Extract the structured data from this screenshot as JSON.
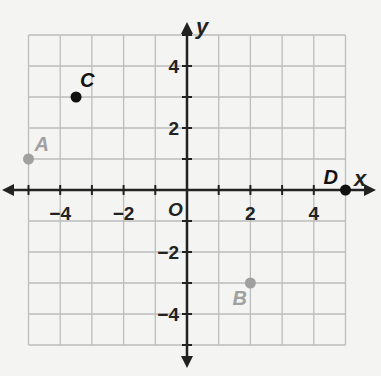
{
  "axes": {
    "x_label": "x",
    "y_label": "y",
    "origin_label": "O",
    "x_ticks": [
      {
        "value": -4,
        "label": "−4"
      },
      {
        "value": -2,
        "label": "−2"
      },
      {
        "value": 2,
        "label": "2"
      },
      {
        "value": 4,
        "label": "4"
      }
    ],
    "y_ticks": [
      {
        "value": 4,
        "label": "4"
      },
      {
        "value": 2,
        "label": "2"
      },
      {
        "value": -2,
        "label": "−2"
      },
      {
        "value": -4,
        "label": "−4"
      }
    ],
    "range": {
      "x": [
        -5,
        5
      ],
      "y": [
        -5,
        5
      ]
    }
  },
  "points": [
    {
      "name": "A",
      "x": -5,
      "y": 1,
      "color": "#a0a0a0"
    },
    {
      "name": "B",
      "x": 2,
      "y": -3,
      "color": "#a0a0a0"
    },
    {
      "name": "C",
      "x": -3.5,
      "y": 3,
      "color": "#111111"
    },
    {
      "name": "D",
      "x": 5,
      "y": 0,
      "color": "#111111"
    }
  ],
  "colors": {
    "grid": "#bdbdbd",
    "axis": "#222222",
    "background": "#f4f4f2"
  }
}
